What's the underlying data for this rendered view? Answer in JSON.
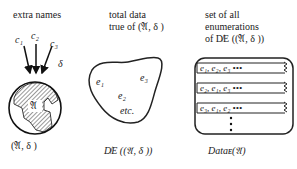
{
  "panel1": {
    "heading": "extra names",
    "names": [
      "c₁",
      "c₂",
      "c₃"
    ],
    "delta": "δ",
    "globe_label": "𝔄",
    "caption": "(𝔄, δ )"
  },
  "panel2": {
    "heading_line1": "total data",
    "heading_line2": "true of (𝔄, δ )",
    "items": [
      "e₁",
      "e₂",
      "e₃",
      "etc."
    ],
    "caption": "D̸E ((𝔄, δ ))"
  },
  "panel3": {
    "heading_line1": "set of all",
    "heading_line2": "enumerations",
    "heading_line3": "of D̸E ((𝔄, δ ))",
    "rows": [
      "e₁, e₂, e₃ •••",
      "e₂, e₁, e₃ •••",
      "e₃, e₁, e₂ •••"
    ],
    "caption": "Dataᴇ(𝔄)"
  }
}
